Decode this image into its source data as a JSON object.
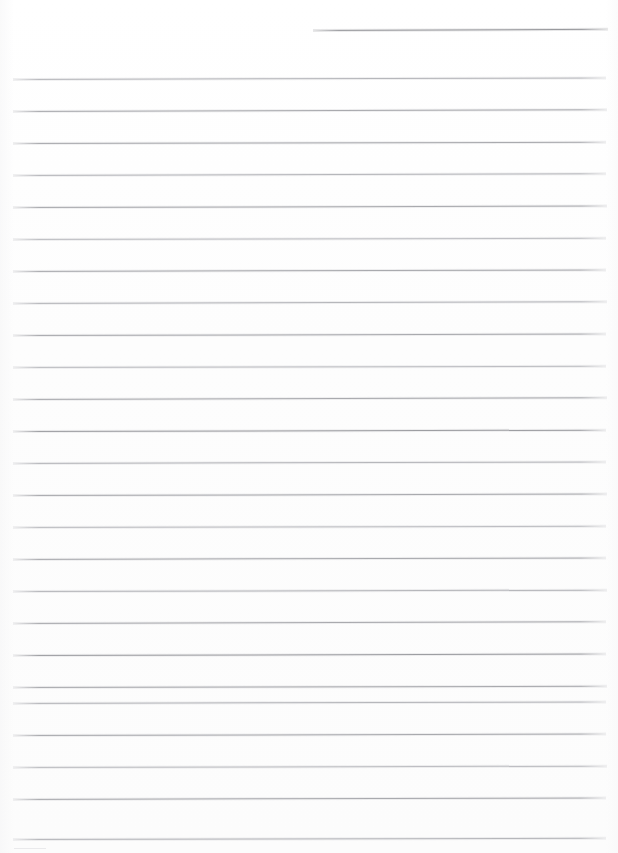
{
  "document": {
    "kind": "scanned-lined-paper",
    "title": "Blank ruled notebook page",
    "page_width": 618,
    "page_height": 853,
    "background_color": "#fefefe",
    "rule_color": "#a9aaae",
    "rule_color_light": "#c2c3c7",
    "rule_thickness": 1,
    "line_spacing": 32,
    "left_margin": 13,
    "right_margin": 606,
    "text_content": "",
    "visible_text_count": 0
  },
  "rules": [
    {
      "id": "header-rule",
      "y": 30,
      "x1": 313,
      "x2": 608,
      "weight": "strong",
      "tilt": -0.25
    },
    {
      "id": "rule-01",
      "y": 79,
      "x1": 13,
      "x2": 606,
      "weight": "faint",
      "tilt": -0.15
    },
    {
      "id": "rule-02",
      "y": 111,
      "x1": 13,
      "x2": 607,
      "weight": "normal",
      "tilt": -0.18
    },
    {
      "id": "rule-03",
      "y": 143,
      "x1": 13,
      "x2": 606,
      "weight": "normal",
      "tilt": -0.12
    },
    {
      "id": "rule-04",
      "y": 175,
      "x1": 13,
      "x2": 606,
      "weight": "faint",
      "tilt": -0.16
    },
    {
      "id": "rule-05",
      "y": 207,
      "x1": 13,
      "x2": 607,
      "weight": "normal",
      "tilt": -0.14
    },
    {
      "id": "rule-06",
      "y": 239,
      "x1": 13,
      "x2": 606,
      "weight": "soft",
      "tilt": -0.12
    },
    {
      "id": "rule-07",
      "y": 271,
      "x1": 13,
      "x2": 606,
      "weight": "normal",
      "tilt": -0.15
    },
    {
      "id": "rule-08",
      "y": 303,
      "x1": 13,
      "x2": 607,
      "weight": "faint",
      "tilt": -0.18
    },
    {
      "id": "rule-09",
      "y": 335,
      "x1": 13,
      "x2": 606,
      "weight": "normal",
      "tilt": -0.14
    },
    {
      "id": "rule-10",
      "y": 367,
      "x1": 13,
      "x2": 606,
      "weight": "soft",
      "tilt": -0.12
    },
    {
      "id": "rule-11",
      "y": 399,
      "x1": 13,
      "x2": 607,
      "weight": "normal",
      "tilt": -0.16
    },
    {
      "id": "rule-12",
      "y": 431,
      "x1": 13,
      "x2": 606,
      "weight": "strong",
      "tilt": -0.13
    },
    {
      "id": "rule-13",
      "y": 463,
      "x1": 13,
      "x2": 606,
      "weight": "faint",
      "tilt": -0.15
    },
    {
      "id": "rule-14",
      "y": 495,
      "x1": 13,
      "x2": 607,
      "weight": "normal",
      "tilt": -0.14
    },
    {
      "id": "rule-15",
      "y": 527,
      "x1": 13,
      "x2": 606,
      "weight": "soft",
      "tilt": -0.12
    },
    {
      "id": "rule-16",
      "y": 559,
      "x1": 13,
      "x2": 606,
      "weight": "normal",
      "tilt": -0.15
    },
    {
      "id": "rule-17",
      "y": 591,
      "x1": 13,
      "x2": 607,
      "weight": "faint",
      "tilt": -0.13
    },
    {
      "id": "rule-18",
      "y": 623,
      "x1": 13,
      "x2": 606,
      "weight": "normal",
      "tilt": -0.16
    },
    {
      "id": "rule-19",
      "y": 655,
      "x1": 13,
      "x2": 606,
      "weight": "strong",
      "tilt": -0.14
    },
    {
      "id": "rule-20",
      "y": 687,
      "x1": 13,
      "x2": 607,
      "weight": "normal",
      "tilt": -0.12
    },
    {
      "id": "rule-21",
      "y": 703,
      "x1": 13,
      "x2": 606,
      "weight": "faint",
      "tilt": -0.15
    },
    {
      "id": "rule-22",
      "y": 735,
      "x1": 13,
      "x2": 606,
      "weight": "normal",
      "tilt": -0.14
    },
    {
      "id": "rule-23",
      "y": 767,
      "x1": 13,
      "x2": 607,
      "weight": "soft",
      "tilt": -0.13
    },
    {
      "id": "rule-24",
      "y": 799,
      "x1": 13,
      "x2": 606,
      "weight": "normal",
      "tilt": -0.15
    },
    {
      "id": "rule-25",
      "y": 839,
      "x1": 13,
      "x2": 606,
      "weight": "faint",
      "tilt": -0.12
    }
  ],
  "artifacts": [
    {
      "id": "bottom-edge-fragment",
      "y": 848,
      "x1": 14,
      "x2": 46,
      "opacity": 0.35
    }
  ]
}
